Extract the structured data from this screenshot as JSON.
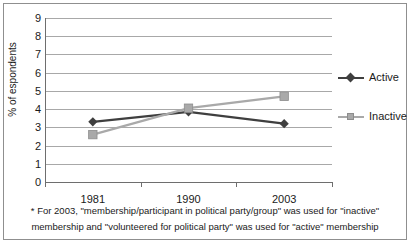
{
  "chart_data": {
    "type": "line",
    "title": "",
    "xlabel": "",
    "ylabel": "% of espondents",
    "categories": [
      "1981",
      "1990",
      "2003"
    ],
    "ylim": [
      0,
      9
    ],
    "yticks": [
      9,
      8,
      7,
      6,
      5,
      4,
      3,
      2,
      1,
      0
    ],
    "grid": true,
    "legend_position": "right",
    "series": [
      {
        "name": "Active",
        "values": [
          3.3,
          3.85,
          3.2
        ],
        "color": "#3f3f3f",
        "marker": "diamond"
      },
      {
        "name": "Inactive",
        "values": [
          2.6,
          4.05,
          4.7
        ],
        "color": "#a9a9a9",
        "marker": "square"
      }
    ],
    "annotations": [
      "* For 2003, \"membership/participant in political party/group\" was used for \"inactive\"",
      "membership and \"volunteered for political party\" was used for \"active\" membership"
    ]
  },
  "legend": {
    "items": [
      {
        "label": "Active"
      },
      {
        "label": "Inactive"
      }
    ]
  },
  "footnotes": {
    "line1": "* For 2003, \"membership/participant in political party/group\" was used for \"inactive\"",
    "line2": "membership and \"volunteered for political party\" was used for \"active\" membership"
  },
  "axes": {
    "y_title": "% of espondents",
    "y_tick_labels": [
      "9",
      "8",
      "7",
      "6",
      "5",
      "4",
      "3",
      "2",
      "1",
      "0"
    ],
    "x_tick_labels": [
      "1981",
      "1990",
      "2003"
    ]
  }
}
